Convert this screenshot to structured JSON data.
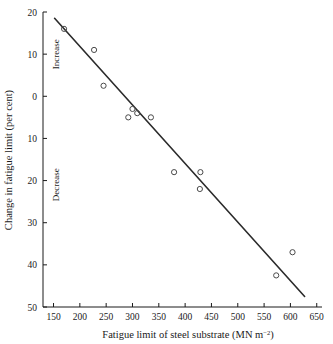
{
  "chart_data": {
    "type": "scatter",
    "title": "",
    "xlabel": "Fatigue limit of steel substrate  (MN m⁻²)",
    "ylabel": "Change in fatigue limit (per cent)",
    "xlim": [
      130,
      660
    ],
    "ylim": [
      -50,
      20
    ],
    "grid": false,
    "legend": null,
    "xticks": [
      150,
      200,
      250,
      300,
      350,
      400,
      450,
      500,
      550,
      600,
      650
    ],
    "xtick_labels": [
      "150",
      "200",
      "250",
      "300",
      "350",
      "400",
      "450",
      "500",
      "550",
      "600",
      "650"
    ],
    "yticks": [
      20,
      10,
      0,
      -10,
      -20,
      -30,
      -40,
      -50
    ],
    "ytick_labels": [
      "20",
      "10",
      "0",
      "10",
      "20",
      "30",
      "40",
      "50"
    ],
    "annotations": [
      {
        "text": "Increase",
        "x": 160,
        "y": 10,
        "orientation": "vertical"
      },
      {
        "text": "Decrease",
        "x": 160,
        "y": -21,
        "orientation": "vertical"
      }
    ],
    "series": [
      {
        "name": "measurements",
        "marker": "open-circle",
        "points": [
          {
            "x": 170,
            "y": 16
          },
          {
            "x": 227,
            "y": 11
          },
          {
            "x": 245,
            "y": 2.5
          },
          {
            "x": 292,
            "y": -5
          },
          {
            "x": 300,
            "y": -3
          },
          {
            "x": 309,
            "y": -4
          },
          {
            "x": 335,
            "y": -5
          },
          {
            "x": 379,
            "y": -18
          },
          {
            "x": 429,
            "y": -18
          },
          {
            "x": 428,
            "y": -22
          },
          {
            "x": 573,
            "y": -42.5
          },
          {
            "x": 604,
            "y": -37
          }
        ]
      },
      {
        "name": "fit-line",
        "marker": "line",
        "points": [
          {
            "x": 152,
            "y": 18.5
          },
          {
            "x": 627,
            "y": -47.5
          }
        ]
      }
    ],
    "colors": {
      "axis": "#1a1a1a",
      "marker": "#4a4a4a",
      "line": "#2b2b2b",
      "background": "#ffffff"
    }
  },
  "xaxis_label_main": "Fatigue limit of steel substrate  (MN m",
  "xaxis_label_sup": "−2",
  "xaxis_label_tail": ")"
}
